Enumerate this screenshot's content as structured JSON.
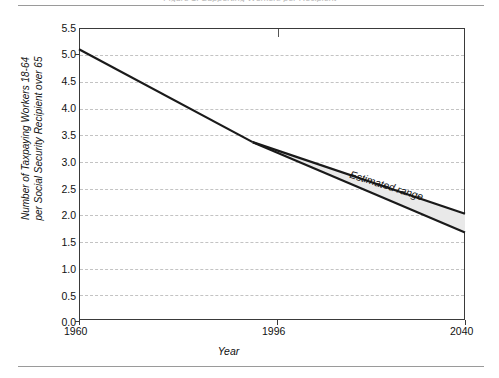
{
  "figure": {
    "clipped_header": "Figure 1. Supporting Workers per Recipient",
    "estimated_range_label": "Estimated range"
  },
  "chart_data": {
    "type": "line",
    "title": "",
    "xlabel": "Year",
    "ylabel": "Number of Taxpaying Workers 18-64 per Social Security Recipient over 65",
    "ylabel_line1": "Number of Taxpaying Workers 18-64",
    "ylabel_line2": "per Social Security Recipient over 65",
    "xlim": [
      1960,
      2040
    ],
    "ylim": [
      0.0,
      5.5
    ],
    "grid": true,
    "grid_style": "dashed horizontal",
    "legend": "none",
    "x_ticks": [
      1960,
      1996,
      2040
    ],
    "x_tick_labels": [
      "1960",
      "1996",
      "2040"
    ],
    "y_ticks": [
      0.0,
      0.5,
      1.0,
      1.5,
      2.0,
      2.5,
      3.0,
      3.5,
      4.0,
      4.5,
      5.0,
      5.5
    ],
    "y_tick_labels": [
      "0.0",
      "0.5",
      "1.0",
      "1.5",
      "2.0",
      "2.5",
      "3.0",
      "3.5",
      "4.0",
      "4.5",
      "5.0",
      "5.5"
    ],
    "series": [
      {
        "name": "Historical",
        "x": [
          1960,
          1996
        ],
        "values": [
          5.1,
          3.35
        ]
      },
      {
        "name": "Estimated range upper bound",
        "x": [
          1996,
          2040
        ],
        "values": [
          3.35,
          2.0
        ]
      },
      {
        "name": "Estimated range lower bound",
        "x": [
          1996,
          2040
        ],
        "values": [
          3.35,
          1.65
        ]
      }
    ],
    "shaded_band": {
      "label": "Estimated range",
      "x": [
        1996,
        2040
      ],
      "upper": [
        3.35,
        2.0
      ],
      "lower": [
        3.35,
        1.65
      ],
      "fill_color": "#e9e9e9"
    },
    "annotations": [
      {
        "text": "Estimated range",
        "x": 2010,
        "y": 2.85,
        "rotation_deg": 17.5
      }
    ],
    "colors": {
      "line": "#1a1a1a",
      "band_fill": "#e9e9e9",
      "grid": "#c3c3c3",
      "frame": "#3a3a3a",
      "background": "#ffffff"
    }
  }
}
